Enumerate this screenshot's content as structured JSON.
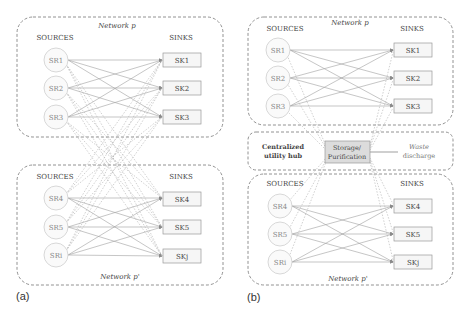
{
  "panel_a": {
    "label": "(a)",
    "network_top": {
      "title": "Network p",
      "sources_header": "SOURCES",
      "sinks_header": "SINKS",
      "sources": [
        "SR1",
        "SR2",
        "SR3"
      ],
      "sinks": [
        "SK1",
        "SK2",
        "SK3"
      ]
    },
    "network_bottom": {
      "title": "Network p'",
      "sources_header": "SOURCES",
      "sinks_header": "SINKS",
      "sources": [
        "SR4",
        "SR5",
        "SRi"
      ],
      "sinks": [
        "SK4",
        "SK5",
        "SKj"
      ]
    }
  },
  "panel_b": {
    "label": "(b)",
    "network_top": {
      "title": "Network p",
      "sources_header": "SOURCES",
      "sinks_header": "SINKS",
      "sources": [
        "SR1",
        "SR2",
        "SR3"
      ],
      "sinks": [
        "SK1",
        "SK2",
        "SK3"
      ]
    },
    "hub": {
      "title_line1": "Centralized",
      "title_line2": "utility hub",
      "unit_line1": "Storage/",
      "unit_line2": "Purification",
      "waste_line1": "Waste",
      "waste_line2": "discharge"
    },
    "network_bottom": {
      "title": "Network p'",
      "sources_header": "SOURCES",
      "sinks_header": "SINKS",
      "sources": [
        "SR4",
        "SR5",
        "SRi"
      ],
      "sinks": [
        "SK4",
        "SK5",
        "SKj"
      ]
    }
  },
  "colors": {
    "line": "#9a9a9a",
    "text": "#444444",
    "box_fill": "#f6f6f6",
    "storage_fill": "#dcdcdc",
    "dashed": "#777777"
  }
}
